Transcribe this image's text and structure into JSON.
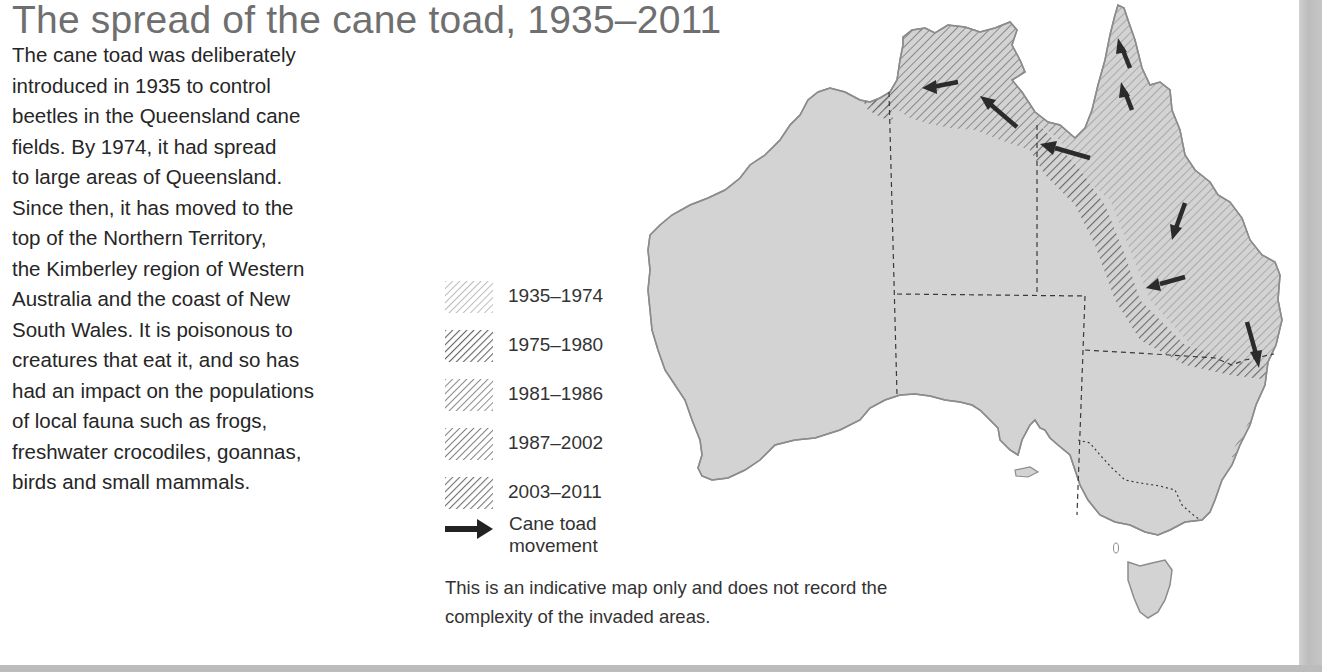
{
  "title": "The spread of the cane toad, 1935–2011",
  "intro_lines": [
    "The cane toad was deliberately",
    "introduced in 1935 to control",
    "beetles in the Queensland cane",
    "fields. By 1974, it had spread",
    "to large areas of Queensland.",
    "Since then, it has moved to the",
    "top of the Northern Territory,",
    "the Kimberley region of Western",
    "Australia and the coast of New",
    "South Wales. It is poisonous to",
    "creatures that eat it, and so has",
    "had an impact on the populations",
    "of local fauna such as frogs,",
    "freshwater crocodiles, goannas,",
    "birds and small mammals."
  ],
  "legend": {
    "periods": [
      {
        "label": "1935–1974",
        "hatch_color": "#b8b8b8"
      },
      {
        "label": "1975–1980",
        "hatch_color": "#6e6e6e"
      },
      {
        "label": "1981–1986",
        "hatch_color": "#8a8a8a"
      },
      {
        "label": "1987–2002",
        "hatch_color": "#7e7e7e"
      },
      {
        "label": "2003–2011",
        "hatch_color": "#747474"
      }
    ],
    "movement_label": "Cane toad movement",
    "movement_icon": "arrow-right-icon"
  },
  "note_lines": [
    "This is an indicative map only and does not record the",
    "complexity of the invaded areas."
  ],
  "map": {
    "land_color": "#d3d3d3",
    "coast_color": "#8c8c8c",
    "border_color": "#3a3a3a",
    "arrow_color": "#2b2b2b",
    "regions": [
      "Western Australia",
      "Northern Territory",
      "Queensland",
      "South Australia",
      "New South Wales",
      "Victoria",
      "Tasmania"
    ],
    "movement_arrows": 9
  }
}
